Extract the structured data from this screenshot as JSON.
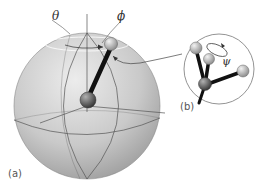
{
  "figure": {
    "labels": {
      "theta": "θ",
      "phi": "ϕ",
      "psi": "ψ",
      "panel_a": "(a)",
      "panel_b": "(b)"
    },
    "colors": {
      "sphere_light": "#e6e6e6",
      "sphere_dark": "#9a9a9a",
      "lines": "#555555",
      "rod": "#111111",
      "atom_light": "#d8d8d8",
      "atom_dark": "#6b6b6b"
    }
  }
}
